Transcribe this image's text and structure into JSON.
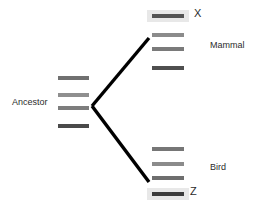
{
  "diagram": {
    "background_color": "#ffffff",
    "branch_color": "#000000",
    "halo_color": "#e8e8e8"
  },
  "labels": {
    "ancestor": "Ancestor",
    "x": "X",
    "mammal": "Mammal",
    "bird": "Bird",
    "z": "Z"
  },
  "chart_data": {
    "type": "diagram",
    "groups": [
      {
        "name": "ancestor",
        "label": "Ancestor",
        "x": 58,
        "width": 31,
        "bands": [
          {
            "y": 76,
            "color": "#707070",
            "width": 31,
            "halo": false
          },
          {
            "y": 93,
            "color": "#8f8f8f",
            "width": 31,
            "halo": false
          },
          {
            "y": 106,
            "color": "#7d7d7d",
            "width": 31,
            "halo": false
          },
          {
            "y": 124,
            "color": "#4a4a4a",
            "width": 31,
            "halo": false
          }
        ]
      },
      {
        "name": "mammal",
        "label": "Mammal",
        "x": 152,
        "width": 32,
        "bands": [
          {
            "y": 14,
            "color": "#545454",
            "width": 32,
            "halo": true
          },
          {
            "y": 33,
            "color": "#8b8b8b",
            "width": 32,
            "halo": false
          },
          {
            "y": 47,
            "color": "#7a7a7a",
            "width": 32,
            "halo": false
          },
          {
            "y": 66,
            "color": "#4f4f4f",
            "width": 32,
            "halo": false
          }
        ]
      },
      {
        "name": "bird",
        "label": "Bird",
        "x": 152,
        "width": 32,
        "bands": [
          {
            "y": 147,
            "color": "#767676",
            "width": 32,
            "halo": false
          },
          {
            "y": 162,
            "color": "#8b8b8b",
            "width": 32,
            "halo": false
          },
          {
            "y": 176,
            "color": "#6e6e6e",
            "width": 32,
            "halo": false
          },
          {
            "y": 192,
            "color": "#3c3c3c",
            "width": 32,
            "halo": true
          }
        ]
      }
    ],
    "branches": [
      {
        "name": "upper-branch",
        "from": [
          92,
          106
        ],
        "to": [
          149,
          38
        ]
      },
      {
        "name": "lower-branch",
        "from": [
          92,
          106
        ],
        "to": [
          149,
          182
        ]
      }
    ],
    "annotations": [
      {
        "name": "ancestor",
        "text": "Ancestor",
        "x": 12,
        "y": 98,
        "size": "small"
      },
      {
        "name": "x",
        "text": "X",
        "x": 194,
        "y": 8,
        "size": "big"
      },
      {
        "name": "mammal",
        "text": "Mammal",
        "x": 210,
        "y": 41,
        "size": "small"
      },
      {
        "name": "bird",
        "text": "Bird",
        "x": 210,
        "y": 163,
        "size": "small"
      },
      {
        "name": "z",
        "text": "Z",
        "x": 190,
        "y": 186,
        "size": "big"
      }
    ]
  }
}
